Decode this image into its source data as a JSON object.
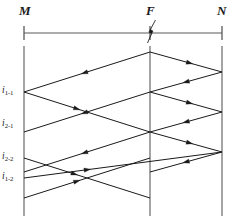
{
  "figure": {
    "type": "lattice-reflection-diagram",
    "width": 236,
    "height": 222,
    "background": "#ffffff",
    "line_color": "#1a1a1a",
    "axis_color": "#5a5a5a"
  },
  "bus_labels": [
    {
      "id": "M",
      "text": "M",
      "x": 24,
      "y": 33,
      "label_x": 19,
      "label_y": 4
    },
    {
      "id": "F",
      "text": "F",
      "x": 150,
      "y": 33,
      "label_x": 146,
      "label_y": 4
    },
    {
      "id": "N",
      "text": "N",
      "x": 222,
      "y": 33,
      "label_x": 217,
      "label_y": 4
    }
  ],
  "fault_marker": {
    "name": "fault-lightning-symbol",
    "at_bus": "F",
    "x": 150,
    "y": 33
  },
  "single_line": {
    "y": 33,
    "x_start": 24,
    "x_end": 222,
    "tick_half_height": 7
  },
  "time_axes": {
    "y_top": 46,
    "y_bottom": 216,
    "buses": [
      "M",
      "F",
      "N"
    ]
  },
  "wave_labels": [
    {
      "id": "i1-1",
      "base": "i",
      "sub": "1-1",
      "x": 2,
      "y": 86,
      "axis_y": 92
    },
    {
      "id": "i2-1",
      "base": "i",
      "sub": "2-1",
      "x": 2,
      "y": 119,
      "axis_y": 125
    },
    {
      "id": "i2-2",
      "base": "i",
      "sub": "2-2",
      "x": 2,
      "y": 152,
      "axis_y": 158
    },
    {
      "id": "i1-2",
      "base": "i",
      "sub": "1-2",
      "x": 2,
      "y": 172,
      "axis_y": 178
    }
  ],
  "travelling_waves": [
    {
      "name": "F-to-M-first",
      "from": [
        150,
        52
      ],
      "to": [
        24,
        92
      ],
      "arrow_t": 0.52,
      "direction": "left"
    },
    {
      "name": "F-to-N-first",
      "from": [
        150,
        52
      ],
      "to": [
        222,
        72
      ],
      "arrow_t": 0.55,
      "direction": "right"
    },
    {
      "name": "M-reflect-1",
      "from": [
        24,
        92
      ],
      "to": [
        150,
        132
      ],
      "arrow_t": 0.42,
      "direction": "right"
    },
    {
      "name": "N-reflect-1",
      "from": [
        222,
        72
      ],
      "to": [
        150,
        92
      ],
      "arrow_t": 0.5,
      "direction": "left"
    },
    {
      "name": "F-to-N-second",
      "from": [
        150,
        92
      ],
      "to": [
        222,
        112
      ],
      "arrow_t": 0.55,
      "direction": "right"
    },
    {
      "name": "F-to-M-second",
      "from": [
        150,
        92
      ],
      "to": [
        24,
        132
      ],
      "arrow_t": 0.52,
      "direction": "left"
    },
    {
      "name": "N-reflect-2",
      "from": [
        222,
        112
      ],
      "to": [
        150,
        132
      ],
      "arrow_t": 0.5,
      "direction": "left"
    },
    {
      "name": "M-reflect-2",
      "from": [
        24,
        158
      ],
      "to": [
        150,
        198
      ],
      "arrow_t": 0.4,
      "direction": "right"
    },
    {
      "name": "F-to-N-third",
      "from": [
        150,
        132
      ],
      "to": [
        222,
        152
      ],
      "arrow_t": 0.55,
      "direction": "right"
    },
    {
      "name": "N-reflect-3",
      "from": [
        222,
        152
      ],
      "to": [
        150,
        172
      ],
      "arrow_t": 0.5,
      "direction": "left"
    },
    {
      "name": "F-to-M-third",
      "from": [
        150,
        132
      ],
      "to": [
        24,
        172
      ],
      "arrow_t": 0.52,
      "direction": "left"
    },
    {
      "name": "M-reflect-3",
      "from": [
        24,
        178
      ],
      "to": [
        222,
        152
      ],
      "arrow_t": 0.32,
      "direction": "right"
    },
    {
      "name": "M-reflect-4",
      "from": [
        24,
        198
      ],
      "to": [
        150,
        158
      ],
      "arrow_t": 0.42,
      "direction": "right"
    }
  ]
}
